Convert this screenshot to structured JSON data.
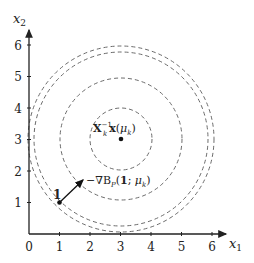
{
  "figure": {
    "type": "contour-diagram",
    "axes": {
      "x_label": "x",
      "x_label_sub": "1",
      "y_label": "x",
      "y_label_sub": "2",
      "x_ticks": [
        "0",
        "1",
        "2",
        "3",
        "4",
        "5",
        "6"
      ],
      "y_ticks": [
        "1",
        "2",
        "3",
        "4",
        "5",
        "6"
      ],
      "xlim": [
        0,
        6.5
      ],
      "ylim": [
        0,
        6.5
      ]
    },
    "center_point": {
      "x": 3,
      "y": 3,
      "label": "X_k^{-1} x(μ_k)",
      "label_main": "X",
      "label_sub": "k",
      "label_sup": "−1",
      "label_rest": "x(μ",
      "label_rest_sub": "k",
      "label_close": ")"
    },
    "start_point": {
      "x": 1,
      "y": 1,
      "label": "1"
    },
    "gradient_arrow": {
      "from": [
        1,
        1
      ],
      "to": [
        1.8,
        1.8
      ],
      "label": "−∇B_P(1; μ_k)",
      "label_prefix": "−∇B",
      "label_sub": "P",
      "label_args": "(1; μ",
      "label_args_sub": "k",
      "label_close": ")"
    },
    "contours": [
      {
        "radius_units": 1.0,
        "style": "dashed"
      },
      {
        "radius_units": 2.0,
        "style": "dashed"
      },
      {
        "radius_units": 2.83,
        "style": "dashed"
      },
      {
        "radius_units": 3.03,
        "style": "dashed"
      }
    ],
    "colors": {
      "axis": "#222222",
      "contour": "#6b6b6b",
      "point": "#111111",
      "arrow": "#111111"
    }
  }
}
